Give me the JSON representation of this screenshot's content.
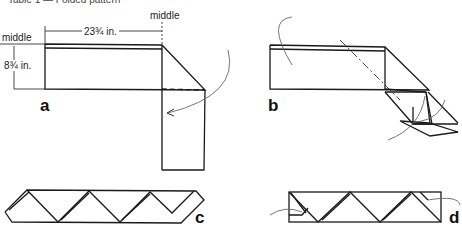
{
  "caption": "Table 1 — Folded pattern",
  "panels": {
    "a": {
      "label": "a",
      "dim_width": "23¾ in.",
      "dim_height": "8¾ in.",
      "middle_top": "middle",
      "middle_left": "middle"
    },
    "b": {
      "label": "b"
    },
    "c": {
      "label": "c"
    },
    "d": {
      "label": "d"
    }
  },
  "colors": {
    "line": "#1a1a1a",
    "arrow": "#777777"
  }
}
